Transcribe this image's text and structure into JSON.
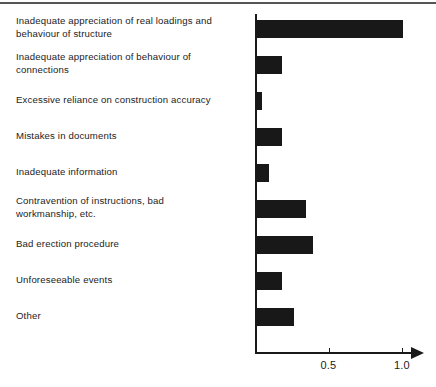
{
  "chart_data": {
    "type": "bar",
    "orientation": "horizontal",
    "title": "",
    "subtitle": "",
    "xlabel": "",
    "ylabel": "",
    "xlim": [
      0,
      1.1
    ],
    "grid": false,
    "legend": null,
    "axis_arrow": true,
    "tick_labels": [
      "0.5",
      "1.0"
    ],
    "tick_values": [
      0.5,
      1.0
    ],
    "categories": [
      "Inadequate appreciation of real loadings and\nbehaviour of structure",
      "Inadequate appreciation of behaviour of\nconnections",
      "Excessive reliance on construction accuracy",
      "Mistakes in documents",
      "Inadequate information",
      "Contravention of instructions, bad\nworkmanship, etc.",
      "Bad erection procedure",
      "Unforeseeable events",
      "Other"
    ],
    "values": [
      1.0,
      0.18,
      0.04,
      0.18,
      0.09,
      0.34,
      0.39,
      0.18,
      0.26
    ],
    "bar_color": "#181818",
    "axis_color": "#1a1a1a"
  }
}
